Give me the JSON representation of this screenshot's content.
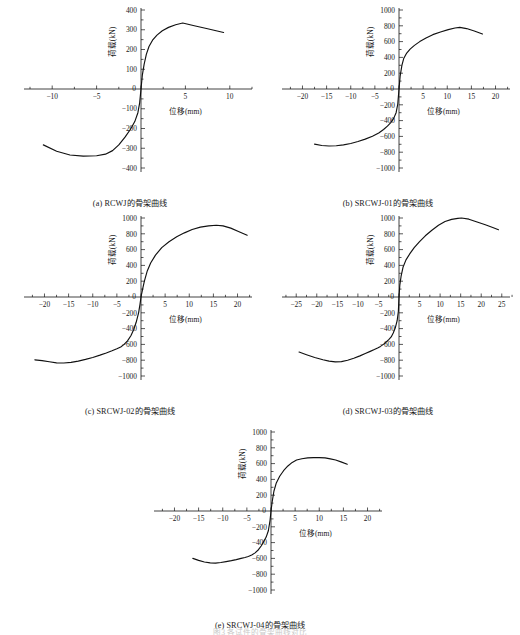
{
  "figure": {
    "bottom_caption": "图3  各试件的骨架曲线对比",
    "axis_labels": {
      "x": "位移(mm)",
      "y": "荷载(kN)"
    }
  },
  "panels": [
    {
      "id": "a",
      "caption": "(a) RCWJ的骨架曲线",
      "chart_data": {
        "type": "line",
        "title": "(a) RCWJ的骨架曲线",
        "xlabel": "位移(mm)",
        "ylabel": "荷载(kN)",
        "xlim": [
          -12.5,
          12.5
        ],
        "ylim": [
          -400,
          400
        ],
        "xticks": [
          -10,
          -5,
          0,
          5,
          10
        ],
        "yticks": [
          -400,
          -300,
          -200,
          -100,
          0,
          100,
          200,
          300,
          400
        ],
        "grid": false,
        "legend": "none",
        "series": [
          {
            "name": "RCWJ骨架曲线",
            "x": [
              -11.0,
              -9.5,
              -8.0,
              -6.5,
              -5.0,
              -4.0,
              -3.2,
              -2.5,
              -1.8,
              -1.2,
              -0.7,
              -0.35,
              -0.15,
              0,
              0.15,
              0.35,
              0.6,
              0.9,
              1.3,
              1.8,
              2.4,
              3.1,
              3.9,
              4.7,
              6.0,
              7.5,
              9.3
            ],
            "y": [
              -283,
              -315,
              -334,
              -340,
              -338,
              -330,
              -312,
              -283,
              -244,
              -205,
              -165,
              -120,
              -70,
              0,
              70,
              125,
              175,
              215,
              247,
              273,
              295,
              312,
              325,
              334,
              320,
              305,
              286
            ]
          }
        ]
      }
    },
    {
      "id": "b",
      "caption": "(b) SRCWJ-01的骨架曲线",
      "chart_data": {
        "type": "line",
        "title": "(b) SRCWJ-01的骨架曲线",
        "xlabel": "位移(mm)",
        "ylabel": "荷载(kN)",
        "xlim": [
          -23,
          23
        ],
        "ylim": [
          -1000,
          1000
        ],
        "xticks": [
          -20,
          -15,
          -10,
          -5,
          0,
          5,
          10,
          15,
          20
        ],
        "yticks": [
          -1000,
          -800,
          -600,
          -400,
          -200,
          0,
          200,
          400,
          600,
          800,
          1000
        ],
        "grid": false,
        "legend": "none",
        "series": [
          {
            "name": "SRCWJ-01骨架曲线",
            "x": [
              -17.5,
              -16.0,
              -14.5,
              -13.0,
              -11.5,
              -10.0,
              -8.5,
              -7.0,
              -5.5,
              -4.2,
              -3.2,
              -2.4,
              -1.7,
              -1.1,
              -0.6,
              -0.25,
              0,
              0.25,
              0.6,
              1.0,
              1.6,
              2.3,
              3.2,
              4.3,
              5.6,
              7.0,
              8.6,
              10.2,
              11.6,
              12.6,
              14.0,
              15.6,
              17.3
            ],
            "y": [
              -698,
              -715,
              -722,
              -718,
              -707,
              -690,
              -665,
              -634,
              -598,
              -556,
              -513,
              -470,
              -425,
              -372,
              -300,
              -190,
              0,
              170,
              300,
              390,
              455,
              505,
              552,
              600,
              645,
              688,
              722,
              752,
              772,
              780,
              765,
              735,
              697
            ]
          }
        ]
      }
    },
    {
      "id": "c",
      "caption": "(c) SRCWJ-02的骨架曲线",
      "chart_data": {
        "type": "line",
        "title": "(c) SRCWJ-02的骨架曲线",
        "xlabel": "位移(mm)",
        "ylabel": "荷载(kN)",
        "xlim": [
          -23,
          23
        ],
        "ylim": [
          -1000,
          1000
        ],
        "xticks": [
          -20,
          -15,
          -10,
          -5,
          0,
          5,
          10,
          15,
          20
        ],
        "yticks": [
          -1000,
          -800,
          -600,
          -400,
          -200,
          0,
          200,
          400,
          600,
          800,
          1000
        ],
        "grid": false,
        "legend": "none",
        "series": [
          {
            "name": "SRCWJ-02骨架曲线",
            "x": [
              -22.0,
              -20.5,
              -19.0,
              -17.5,
              -16.0,
              -14.5,
              -13.0,
              -11.5,
              -10.0,
              -8.5,
              -7.2,
              -6.0,
              -5.0,
              -4.2,
              -3.5,
              -2.8,
              -2.1,
              -1.5,
              -1.0,
              -0.5,
              -0.2,
              0,
              0.3,
              0.7,
              1.3,
              2.0,
              3.0,
              4.3,
              5.8,
              7.4,
              9.0,
              10.6,
              12.3,
              14.0,
              15.6,
              17.0,
              18.6,
              20.2,
              22.0
            ],
            "y": [
              -795,
              -805,
              -820,
              -833,
              -835,
              -828,
              -812,
              -790,
              -765,
              -736,
              -708,
              -680,
              -655,
              -632,
              -600,
              -555,
              -490,
              -410,
              -320,
              -200,
              -90,
              0,
              90,
              200,
              330,
              430,
              530,
              625,
              700,
              762,
              812,
              855,
              885,
              900,
              908,
              900,
              872,
              830,
              782
            ]
          }
        ]
      }
    },
    {
      "id": "d",
      "caption": "(d) SRCWJ-03的骨架曲线",
      "chart_data": {
        "type": "line",
        "title": "(d) SRCWJ-03的骨架曲线",
        "xlabel": "位移(mm)",
        "ylabel": "荷载(kN)",
        "xlim": [
          -27,
          27
        ],
        "ylim": [
          -1000,
          1000
        ],
        "xticks": [
          -25,
          -20,
          -15,
          -10,
          -5,
          0,
          5,
          10,
          15,
          20,
          25
        ],
        "yticks": [
          -1000,
          -800,
          -600,
          -400,
          -200,
          0,
          200,
          400,
          600,
          800,
          1000
        ],
        "grid": false,
        "legend": "none",
        "series": [
          {
            "name": "SRCWJ-03骨架曲线",
            "x": [
              -24.3,
              -22.5,
              -20.5,
              -18.5,
              -17.0,
              -15.5,
              -14.0,
              -12.5,
              -11.0,
              -9.5,
              -8.2,
              -7.0,
              -6.0,
              -5.2,
              -4.5,
              -3.8,
              -3.1,
              -2.5,
              -1.9,
              -1.4,
              -0.9,
              -0.45,
              -0.15,
              0,
              0.2,
              0.5,
              1.0,
              1.7,
              2.6,
              3.7,
              5.0,
              6.4,
              8.0,
              9.6,
              11.2,
              12.8,
              14.3,
              15.2,
              17.0,
              19.0,
              21.0,
              22.8,
              24.2
            ],
            "y": [
              -697,
              -730,
              -765,
              -795,
              -812,
              -822,
              -818,
              -800,
              -775,
              -745,
              -715,
              -688,
              -665,
              -645,
              -625,
              -600,
              -570,
              -540,
              -505,
              -455,
              -390,
              -300,
              -180,
              0,
              150,
              260,
              380,
              470,
              545,
              625,
              700,
              775,
              845,
              908,
              955,
              982,
              995,
              1000,
              985,
              950,
              915,
              880,
              852
            ]
          }
        ]
      }
    },
    {
      "id": "e",
      "caption": "(e) SRCWJ-04的骨架曲线",
      "chart_data": {
        "type": "line",
        "title": "(e) SRCWJ-04的骨架曲线",
        "xlabel": "位移(mm)",
        "ylabel": "荷载(kN)",
        "xlim": [
          -23,
          23
        ],
        "ylim": [
          -1000,
          1000
        ],
        "xticks": [
          -20,
          -15,
          -10,
          -5,
          0,
          5,
          10,
          15,
          20
        ],
        "yticks": [
          -1000,
          -800,
          -600,
          -400,
          -200,
          0,
          200,
          400,
          600,
          800,
          1000
        ],
        "grid": false,
        "legend": "none",
        "series": [
          {
            "name": "SRCWJ-04骨架曲线",
            "x": [
              -16.2,
              -15.0,
              -13.8,
              -12.6,
              -11.5,
              -10.4,
              -9.3,
              -8.2,
              -7.2,
              -6.2,
              -5.4,
              -4.7,
              -4.0,
              -3.3,
              -2.6,
              -2.0,
              -1.5,
              -1.0,
              -0.55,
              -0.2,
              0,
              0.25,
              0.6,
              1.1,
              1.8,
              2.6,
              3.5,
              4.4,
              5.3,
              6.4,
              7.6,
              8.8,
              10.0,
              11.2,
              12.3,
              13.4,
              14.5,
              15.8
            ],
            "y": [
              -600,
              -625,
              -645,
              -657,
              -660,
              -652,
              -640,
              -628,
              -615,
              -600,
              -588,
              -575,
              -558,
              -530,
              -490,
              -440,
              -385,
              -330,
              -250,
              -120,
              0,
              120,
              250,
              355,
              440,
              510,
              570,
              615,
              645,
              662,
              672,
              676,
              676,
              672,
              660,
              645,
              622,
              592
            ]
          }
        ]
      }
    }
  ]
}
